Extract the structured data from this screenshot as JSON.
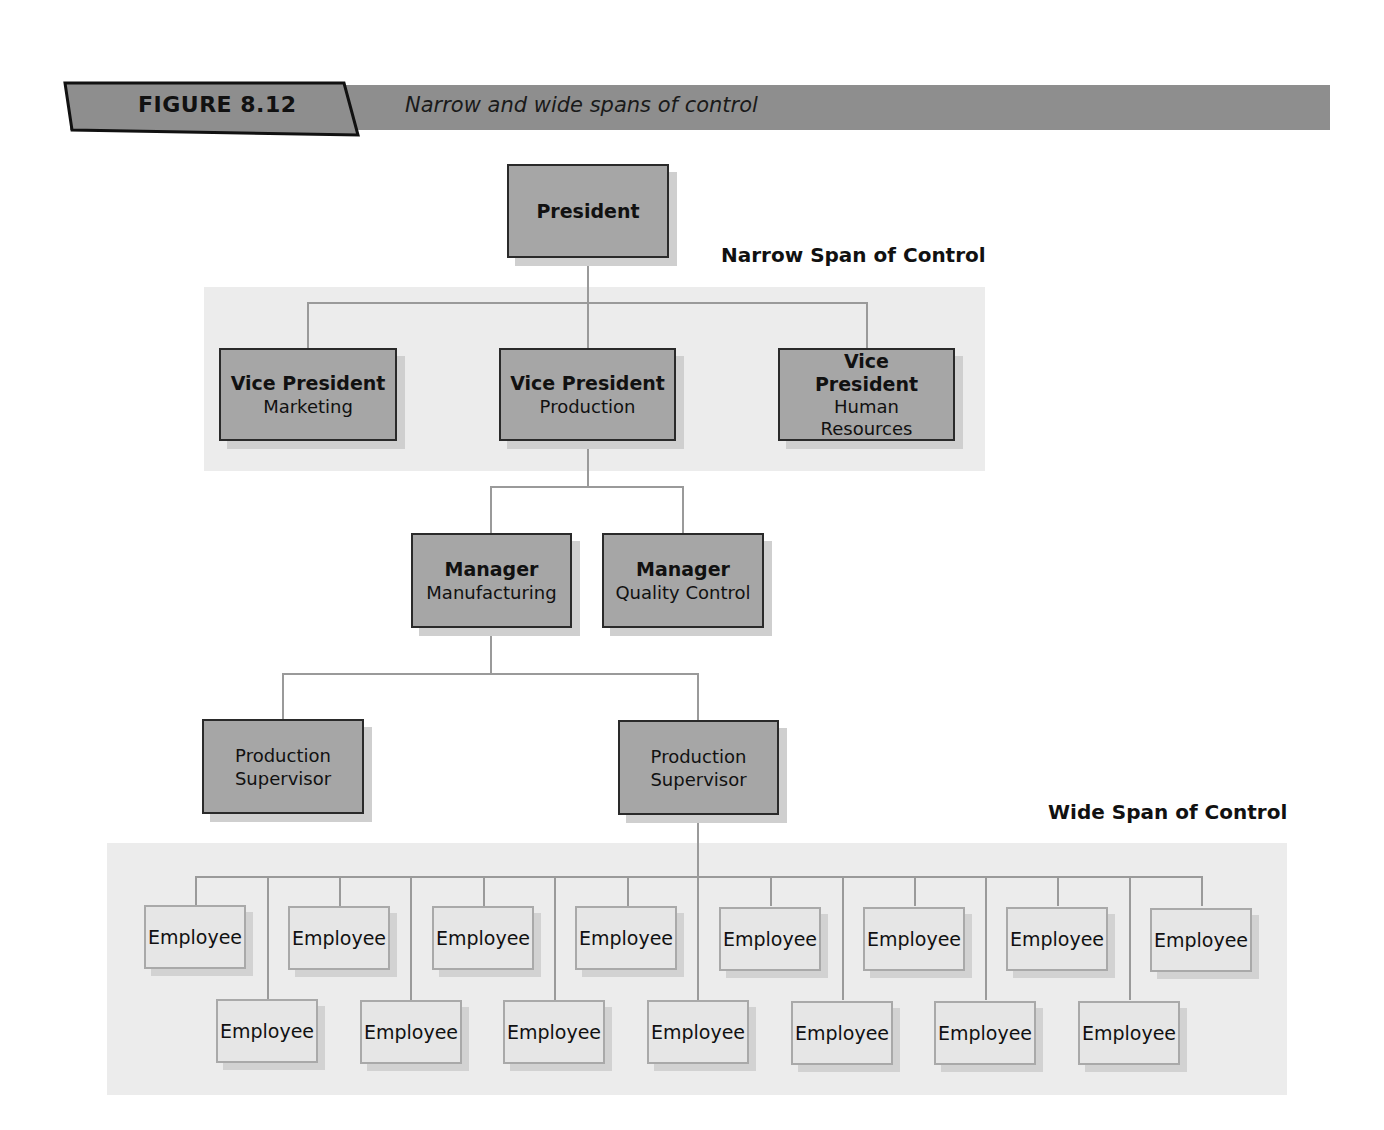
{
  "header": {
    "figure_label": "FIGURE 8.12",
    "figure_title": "Narrow and wide spans of control",
    "banner_color": "#8e8e8e"
  },
  "labels": {
    "narrow": "Narrow Span of Control",
    "wide": "Wide Span of Control"
  },
  "nodes": {
    "president": {
      "title": "President"
    },
    "vp_marketing": {
      "title": "Vice President",
      "sub": "Marketing"
    },
    "vp_production": {
      "title": "Vice President",
      "sub": "Production"
    },
    "vp_hr": {
      "title": "Vice President",
      "sub": "Human Resources"
    },
    "mgr_manufacturing": {
      "title": "Manager",
      "sub": "Manufacturing"
    },
    "mgr_quality": {
      "title": "Manager",
      "sub": "Quality Control"
    },
    "supervisor_1": {
      "sub": "Production Supervisor"
    },
    "supervisor_2": {
      "sub": "Production Supervisor"
    }
  },
  "employees": {
    "label": "Employee",
    "count": 15,
    "top_row": [
      "Employee",
      "Employee",
      "Employee",
      "Employee",
      "Employee",
      "Employee",
      "Employee",
      "Employee"
    ],
    "bottom_row": [
      "Employee",
      "Employee",
      "Employee",
      "Employee",
      "Employee",
      "Employee",
      "Employee"
    ]
  },
  "colors": {
    "dark_box": "#a6a6a6",
    "light_box": "#e6e6e6",
    "region": "#ececec",
    "connector": "#9a9a9a"
  }
}
